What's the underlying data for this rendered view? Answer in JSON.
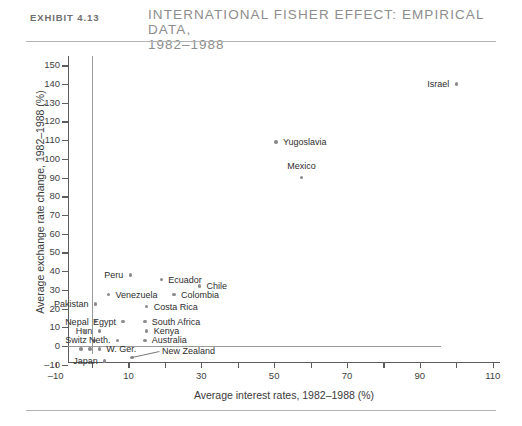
{
  "header": {
    "exhibit_label": "Exhibit 4.13",
    "title_line1": "International Fisher Effect: Empirical Data,",
    "title_line2": "1982–1988"
  },
  "chart_data": {
    "type": "scatter",
    "title": "International Fisher Effect: Empirical Data, 1982–1988",
    "xlabel": "Average interest rates, 1982–1988 (%)",
    "ylabel": "Average exchange rate change, 1982–1988 (%)",
    "xlim": [
      -10,
      112
    ],
    "ylim": [
      -12,
      155
    ],
    "xticks": [
      -10,
      0,
      10,
      20,
      30,
      40,
      50,
      60,
      70,
      80,
      90,
      100,
      110
    ],
    "xtick_labels": [
      "–10",
      "",
      "10",
      "",
      "30",
      "",
      "50",
      "",
      "70",
      "",
      "90",
      "",
      "110"
    ],
    "yticks": [
      -10,
      0,
      10,
      20,
      30,
      40,
      50,
      60,
      70,
      80,
      90,
      100,
      110,
      120,
      130,
      140,
      150
    ],
    "ytick_labels": [
      "–10",
      "0",
      "10",
      "20",
      "30",
      "40",
      "50",
      "60",
      "70",
      "80",
      "90",
      "100",
      "110",
      "120",
      "130",
      "140",
      "150"
    ],
    "grid": false,
    "legend": "none",
    "marker_color": "#8c8c8c",
    "axis_color": "#5c5c5c",
    "points": [
      {
        "name": "Israel",
        "x": 100.0,
        "y": 140.0,
        "label_side": "left",
        "label_dx": -7,
        "label_dy": 0
      },
      {
        "name": "Yugoslavia",
        "x": 50.5,
        "y": 109.0,
        "label_side": "right",
        "label_dx": 7,
        "label_dy": 0
      },
      {
        "name": "Mexico",
        "x": 57.5,
        "y": 90.0,
        "label_side": "above",
        "label_dx": 0,
        "label_dy": -12
      },
      {
        "name": "Peru",
        "x": 10.5,
        "y": 38.0,
        "label_side": "left",
        "label_dx": -7,
        "label_dy": 0
      },
      {
        "name": "Ecuador",
        "x": 19.0,
        "y": 35.5,
        "label_side": "right",
        "label_dx": 7,
        "label_dy": 0
      },
      {
        "name": "Chile",
        "x": 29.5,
        "y": 32.0,
        "label_side": "right",
        "label_dx": 7,
        "label_dy": 0
      },
      {
        "name": "Venezuela",
        "x": 4.5,
        "y": 27.5,
        "label_side": "right",
        "label_dx": 7,
        "label_dy": 0
      },
      {
        "name": "Colombia",
        "x": 22.5,
        "y": 27.5,
        "label_side": "right",
        "label_dx": 7,
        "label_dy": 0
      },
      {
        "name": "Pakistan",
        "x": 1.0,
        "y": 22.5,
        "label_side": "left",
        "label_dx": -7,
        "label_dy": 0
      },
      {
        "name": "Costa Rica",
        "x": 15.0,
        "y": 21.0,
        "label_side": "right",
        "label_dx": 7,
        "label_dy": 0
      },
      {
        "name": "Nepal",
        "x": 1.0,
        "y": 13.0,
        "label_side": "left",
        "label_dx": -7,
        "label_dy": 0
      },
      {
        "name": "Egypt",
        "x": 8.5,
        "y": 13.0,
        "label_side": "left",
        "label_dx": -7,
        "label_dy": 0
      },
      {
        "name": "South Africa",
        "x": 14.5,
        "y": 13.0,
        "label_side": "right",
        "label_dx": 7,
        "label_dy": 0
      },
      {
        "name": "Hun",
        "x": 2.0,
        "y": 8.0,
        "label_side": "left",
        "label_dx": -7,
        "label_dy": 0
      },
      {
        "name": "Kenya",
        "x": 15.0,
        "y": 8.0,
        "label_side": "right",
        "label_dx": 7,
        "label_dy": 0
      },
      {
        "name": "Switz",
        "x": 0.5,
        "y": 3.0,
        "label_side": "left",
        "label_dx": -7,
        "label_dy": 0
      },
      {
        "name": "Neth.",
        "x": 7.0,
        "y": 3.0,
        "label_side": "left",
        "label_dx": -7,
        "label_dy": 0
      },
      {
        "name": "Australia",
        "x": 14.5,
        "y": 3.0,
        "label_side": "right",
        "label_dx": 7,
        "label_dy": 0
      },
      {
        "name": "W. Ger.",
        "x": 2.0,
        "y": -1.5,
        "label_side": "right",
        "label_dx": 7,
        "label_dy": 0
      },
      {
        "name": "New Zealand",
        "x": 11.0,
        "y": -6.0,
        "label_side": "right",
        "label_dx": 30,
        "label_dy": -6
      },
      {
        "name": "Japan",
        "x": 3.5,
        "y": -8.0,
        "label_side": "left",
        "label_dx": -7,
        "label_dy": 0
      }
    ],
    "extra_markers": [
      {
        "x": -2.0,
        "y": 8.0
      },
      {
        "x": -3.0,
        "y": -1.5
      },
      {
        "x": -0.5,
        "y": -1.5
      }
    ]
  }
}
